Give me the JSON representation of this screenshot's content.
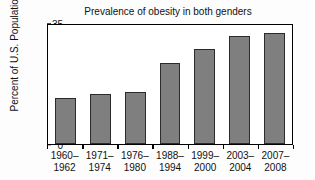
{
  "chart_data": {
    "type": "bar",
    "title": "Prevalence of obesity in both genders",
    "xlabel": "",
    "ylabel": "Percent of U.S. Population",
    "categories": [
      "1960–\n1962",
      "1971–\n1974",
      "1976–\n1980",
      "1988–\n1994",
      "1999–\n2000",
      "2003–\n2004",
      "2007–\n2008"
    ],
    "category_lines": [
      [
        "1960–",
        "1962"
      ],
      [
        "1971–",
        "1974"
      ],
      [
        "1976–",
        "1980"
      ],
      [
        "1988–",
        "1994"
      ],
      [
        "1999–",
        "2000"
      ],
      [
        "2003–",
        "2004"
      ],
      [
        "2007–",
        "2008"
      ]
    ],
    "values": [
      13.3,
      14.6,
      15.1,
      23.3,
      27.6,
      31.2,
      32.2
    ],
    "ylim": [
      0,
      35
    ],
    "yticks": [
      0,
      5,
      10,
      15,
      20,
      25,
      30,
      35
    ],
    "ytick_labels": [
      "0",
      "5",
      "10",
      "15",
      "20",
      "25",
      "30",
      "35"
    ],
    "grid": false,
    "legend": false,
    "bar_color": "#7f7f7f",
    "bar_edge_color": "#2b2b2b",
    "frame_color": "#000000",
    "background": "#ffffff"
  }
}
